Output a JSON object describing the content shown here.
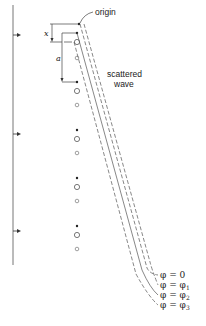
{
  "diagram": {
    "labels": {
      "origin": "origin",
      "scattered_line1": "scattered",
      "scattered_line2": "wave",
      "x": "x",
      "a": "a"
    },
    "phase_labels": [
      {
        "sym": "φ",
        "eq": "=",
        "val": "0",
        "sub": ""
      },
      {
        "sym": "φ",
        "eq": "=",
        "val": "φ",
        "sub": "1"
      },
      {
        "sym": "φ",
        "eq": "=",
        "val": "φ",
        "sub": "2"
      },
      {
        "sym": "φ",
        "eq": "=",
        "val": "φ",
        "sub": "3"
      }
    ],
    "colors": {
      "line": "#555555",
      "text": "#222222"
    }
  }
}
